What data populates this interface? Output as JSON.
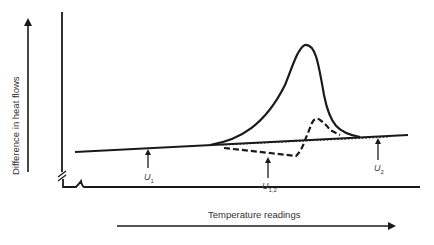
{
  "figure": {
    "y_axis_label": "Difference in heat flows",
    "x_axis_label": "Temperature readings",
    "markers": [
      {
        "symbol": "U",
        "subscript": "1"
      },
      {
        "symbol": "U",
        "subscript": "1,2"
      },
      {
        "symbol": "U",
        "subscript": "2"
      }
    ],
    "curves": [
      {
        "name": "solid-peak-curve",
        "style": "solid"
      },
      {
        "name": "dashed-curve",
        "style": "dashed"
      },
      {
        "name": "dotted-extrapolated-baseline",
        "style": "dotted"
      }
    ],
    "colors": {
      "ink": "#1a1a1a",
      "background": "#ffffff"
    }
  }
}
